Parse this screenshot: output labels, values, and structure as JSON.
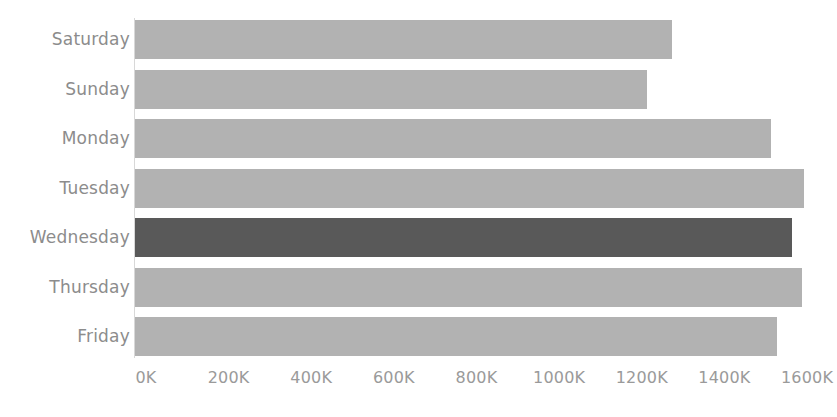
{
  "chart_data": {
    "type": "bar",
    "orientation": "horizontal",
    "title": "",
    "subtitle": "",
    "xlabel": "",
    "ylabel": "",
    "categories": [
      "Saturday",
      "Sunday",
      "Monday",
      "Tuesday",
      "Wednesday",
      "Thursday",
      "Friday"
    ],
    "values": [
      1300000,
      1240000,
      1540000,
      1620000,
      1590000,
      1615000,
      1555000
    ],
    "value_labels": [
      "1300K",
      "1240K",
      "1540K",
      "1620K",
      "1590K",
      "1615K",
      "1555K"
    ],
    "series": [
      {
        "name": "Total",
        "values": [
          1300000,
          1240000,
          1540000,
          1620000,
          1590000,
          1615000,
          1555000
        ]
      }
    ],
    "xlim": [
      0,
      1600000
    ],
    "x_tick_values": [
      0,
      200000,
      400000,
      600000,
      800000,
      1000000,
      1200000,
      1400000,
      1600000
    ],
    "x_tick_labels": [
      "0K",
      "200K",
      "400K",
      "600K",
      "800K",
      "1000K",
      "1200K",
      "1400K",
      "1600K"
    ],
    "grid": false,
    "legend": false,
    "legend_position": "none",
    "highlight_category": "Wednesday",
    "colors": {
      "bar": "#b2b2b2",
      "bar_highlight": "#595959",
      "label_text": "#8c8c8c",
      "tick_text": "#9a9a9a",
      "axis_line": "#d8d8d8",
      "background": "#ffffff"
    }
  },
  "axis": {
    "ticks": [
      {
        "label": "0K",
        "value": 0
      },
      {
        "label": "200K",
        "value": 200000
      },
      {
        "label": "400K",
        "value": 400000
      },
      {
        "label": "600K",
        "value": 600000
      },
      {
        "label": "800K",
        "value": 800000
      },
      {
        "label": "1000K",
        "value": 1000000
      },
      {
        "label": "1200K",
        "value": 1200000
      },
      {
        "label": "1400K",
        "value": 1400000
      },
      {
        "label": "1600K",
        "value": 1600000
      }
    ]
  },
  "rows": [
    {
      "label": "Saturday",
      "value": 1300000,
      "highlight": false
    },
    {
      "label": "Sunday",
      "value": 1240000,
      "highlight": false
    },
    {
      "label": "Monday",
      "value": 1540000,
      "highlight": false
    },
    {
      "label": "Tuesday",
      "value": 1620000,
      "highlight": false
    },
    {
      "label": "Wednesday",
      "value": 1590000,
      "highlight": true
    },
    {
      "label": "Thursday",
      "value": 1615000,
      "highlight": false
    },
    {
      "label": "Friday",
      "value": 1555000,
      "highlight": false
    }
  ]
}
